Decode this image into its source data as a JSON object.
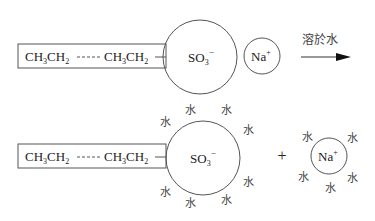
{
  "diagram": {
    "colors": {
      "line": "#555555",
      "text": "#222222",
      "background": "#ffffff"
    },
    "top": {
      "chain": {
        "left_group": "CH3CH2",
        "right_group": "CH3CH2",
        "sub": "3",
        "sub2": "2",
        "ch": "CH",
        "ch2": "CH"
      },
      "head": {
        "label": "SO",
        "sub": "3",
        "sup": "−"
      },
      "counter_ion": {
        "label": "Na",
        "sup": "+"
      },
      "arrow_label": "溶於水"
    },
    "bottom": {
      "chain": {
        "ch": "CH",
        "sub": "3",
        "sub2": "2"
      },
      "head": {
        "label": "SO",
        "sub": "3",
        "sup": "−"
      },
      "plus": "+",
      "counter_ion": {
        "label": "Na",
        "sup": "+"
      },
      "water_label": "水"
    }
  }
}
